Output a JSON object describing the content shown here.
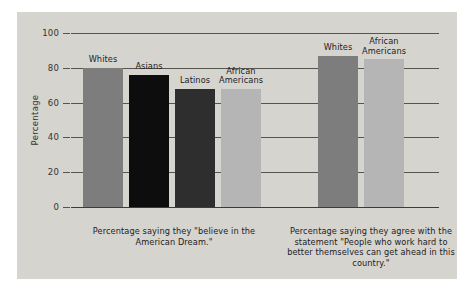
{
  "chart_data": {
    "type": "bar",
    "title": "",
    "xlabel": "",
    "ylabel": "Percentage",
    "ylim": [
      0,
      100
    ],
    "yticks": [
      0,
      20,
      40,
      60,
      80,
      100
    ],
    "ytick_labels": [
      "0",
      "20",
      "40",
      "60",
      "80",
      "100"
    ],
    "grid": true,
    "legend": false,
    "groups": [
      {
        "caption": "Percentage saying they \"believe in the American Dream.\"",
        "bars": [
          {
            "label": "Whites",
            "value": 80,
            "color": "#7d7d7d"
          },
          {
            "label": "Asians",
            "value": 76,
            "color": "#0d0d0d"
          },
          {
            "label": "Latinos",
            "value": 68,
            "color": "#2e2e2e"
          },
          {
            "label": "African\nAmericans",
            "value": 68,
            "color": "#b5b5b5"
          }
        ]
      },
      {
        "caption": "Percentage saying they agree with the statement \"People who work hard to better themselves can get ahead in this country.\"",
        "bars": [
          {
            "label": "Whites",
            "value": 87,
            "color": "#7d7d7d"
          },
          {
            "label": "African\nAmericans",
            "value": 85,
            "color": "#b5b5b5"
          }
        ]
      }
    ],
    "categories": [
      "Whites",
      "Asians",
      "Latinos",
      "African Americans",
      "Whites",
      "African Americans"
    ],
    "values": [
      80,
      76,
      68,
      68,
      87,
      85
    ]
  },
  "figure": {
    "background_color": "#d6d4cf",
    "axis_color": "#56544f"
  }
}
